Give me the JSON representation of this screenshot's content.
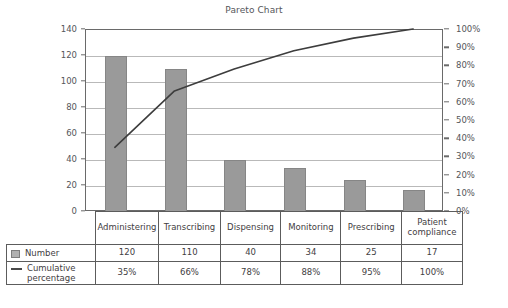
{
  "chart_data": {
    "type": "bar",
    "title": "Pareto Chart",
    "xlabel": "",
    "ylabel": "Number of errors",
    "y2label": "",
    "categories": [
      "Administering",
      "Transcribing",
      "Dispensing",
      "Monitoring",
      "Prescribing",
      "Patient compliance"
    ],
    "series": [
      {
        "name": "Number",
        "type": "bar",
        "values": [
          120,
          110,
          40,
          34,
          25,
          17
        ]
      },
      {
        "name": "Cumulative percentage",
        "type": "line",
        "values": [
          35,
          66,
          78,
          88,
          95,
          100
        ],
        "unit": "%"
      }
    ],
    "ylim": [
      0,
      140
    ],
    "yticks": [
      0,
      20,
      40,
      60,
      80,
      100,
      120,
      140
    ],
    "ytick_labels": [
      "0",
      "20",
      "40",
      "60",
      "80",
      "100",
      "120",
      "140"
    ],
    "y2lim": [
      0,
      100
    ],
    "y2ticks": [
      0,
      10,
      20,
      30,
      40,
      50,
      60,
      70,
      80,
      90,
      100
    ],
    "y2tick_labels": [
      "0%",
      "10%",
      "20%",
      "30%",
      "40%",
      "50%",
      "60%",
      "70%",
      "80%",
      "90%",
      "100%"
    ],
    "grid": true,
    "legend_position": "table-left-column",
    "bar_color": "#9a9a9a",
    "line_color": "#3d3d3d",
    "axis_color": "#6a6a6a",
    "grid_color": "#b9b9b9"
  },
  "table": {
    "categories": [
      "Administering",
      "Transcribing",
      "Dispensing",
      "Monitoring",
      "Prescribing",
      "Patient compliance"
    ],
    "rows": [
      {
        "legend_label": "Number",
        "swatch": "square-swatch",
        "values": [
          "120",
          "110",
          "40",
          "34",
          "25",
          "17"
        ]
      },
      {
        "legend_label": "Cumulative percentage",
        "swatch": "line-swatch",
        "values": [
          "35%",
          "66%",
          "78%",
          "88%",
          "95%",
          "100%"
        ]
      }
    ]
  }
}
